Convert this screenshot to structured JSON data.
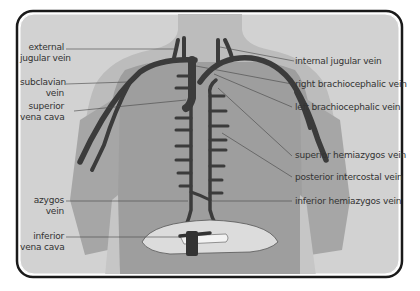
{
  "diagram": {
    "title": "",
    "colors": {
      "frame_fill": "#cfcfcf",
      "frame_border": "#1a1a1a",
      "body_light": "#b8b8b8",
      "body_mid": "#9a9a9a",
      "vein": "#3a3a3a",
      "diaphragm": "#dedede",
      "leader_line": "#444444",
      "text": "#333333"
    },
    "labels_left": [
      {
        "id": "external-jugular-vein",
        "line1": "external",
        "line2": "jugular vein"
      },
      {
        "id": "subclavian-vein",
        "line1": "subclavian",
        "line2": "vein"
      },
      {
        "id": "superior-vena-cava",
        "line1": "superior",
        "line2": "vena cava"
      },
      {
        "id": "azygos-vein",
        "line1": "azygos",
        "line2": "vein"
      },
      {
        "id": "inferior-vena-cava",
        "line1": "inferior",
        "line2": "vena cava"
      }
    ],
    "labels_right": [
      {
        "id": "internal-jugular-vein",
        "text": "internal jugular vein"
      },
      {
        "id": "right-brachiocephalic-vein",
        "text": "right brachiocephalic vein"
      },
      {
        "id": "left-brachiocephalic-vein",
        "text": "left brachiocephalic vein"
      },
      {
        "id": "superior-hemiazygos-vein",
        "text": "superior hemiazygos vein"
      },
      {
        "id": "posterior-intercostal-vein",
        "text": "posterior intercostal vein"
      },
      {
        "id": "inferior-hemiazygos-vein",
        "text": "inferior hemiazygos vein"
      }
    ]
  }
}
